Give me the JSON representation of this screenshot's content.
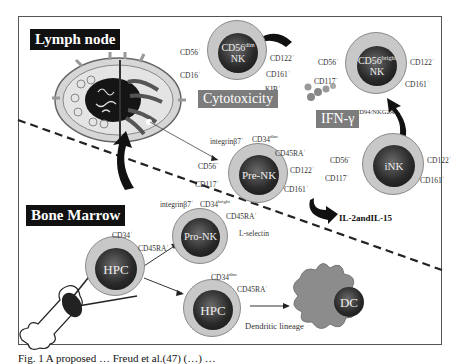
{
  "figure": {
    "regions": {
      "lymph_node": "Lymph node",
      "bone_marrow": "Bone Marrow"
    },
    "cells": {
      "cd56dim": {
        "name_main": "CD56",
        "name_sup": "dim",
        "name_line2": "NK",
        "markers": [
          "CD56+",
          "CD16+",
          "CD122+",
          "CD161+",
          "KIR+"
        ],
        "function": "Cytotoxicity"
      },
      "cd56bright": {
        "name_main": "CD56",
        "name_sup": "bright",
        "name_line2": "NK",
        "markers": [
          "CD56+",
          "CD117-",
          "CD122+",
          "CD161+",
          "CD94/NKG2A+"
        ],
        "function": "IFN-γ"
      },
      "pre_nk": {
        "name": "Pre-NK",
        "markers": [
          "integrinβ7+",
          "CD34dim",
          "CD45RA+",
          "CD56-",
          "CD122+",
          "CD117+",
          "CD161+"
        ]
      },
      "ink": {
        "name": "iNK",
        "markers": [
          "CD56-",
          "CD117+",
          "CD122+",
          "CD161+"
        ]
      },
      "pro_nk": {
        "name": "Pro-NK",
        "markers": [
          "integrinβ7+",
          "CD34bright",
          "CD45RA+",
          "L-selectin"
        ]
      },
      "hpc_left": {
        "name": "HPC",
        "markers": [
          "CD34+",
          "CD45RA+"
        ]
      },
      "hpc_right": {
        "name": "HPC",
        "markers": [
          "CD34dim",
          "CD45RA+"
        ]
      },
      "dc": {
        "name": "DC"
      }
    },
    "labels": {
      "cytokines": "IL-2andIL-15",
      "dendritic_lineage": "Dendritic lineage"
    },
    "marker_text": {
      "cd56_plus": "CD56",
      "cd16_plus": "CD16",
      "cd122": "CD122",
      "cd161": "CD161",
      "kir": "KIR",
      "cd117": "CD117",
      "cd94": "CD94/NKG2A",
      "integrin": "integrinβ7",
      "cd34": "CD34",
      "cd45ra": "CD45RA",
      "lselectin": "L-selectin",
      "sup_plus": "+",
      "sup_minus": "−",
      "sup_dim": "dim",
      "sup_bright": "bright"
    },
    "caption": "Fig. 1  A proposed …  Freud et al.(47) (…) …"
  },
  "colors": {
    "cell_cytoplasm": "#c8c8c8",
    "nucleus": "#222222",
    "function_box": "#7c7c7c",
    "dc_body": "#8c8c8c",
    "label_box": "#111111"
  }
}
